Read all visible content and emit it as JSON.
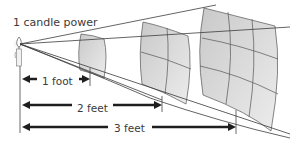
{
  "title": "1 candle power",
  "source": {
    "name": "candle",
    "icon": "candle-icon"
  },
  "distances": [
    {
      "label": "1 foot",
      "feet": 1,
      "grid_cells": 1
    },
    {
      "label": "2 feet",
      "feet": 2,
      "grid_cells": 4
    },
    {
      "label": "3 feet",
      "feet": 3,
      "grid_cells": 9
    }
  ],
  "colors": {
    "panel_fill": "#d4d4d4",
    "panel_fill_light": "#e6e6e6",
    "line": "#3c3c3c",
    "arrow": "#1e1e1e",
    "text": "#3a3a3a"
  }
}
